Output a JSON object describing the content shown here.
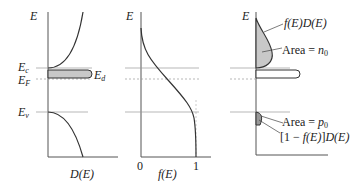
{
  "panels": {
    "dos": {
      "y_label": "E",
      "x_label": "D(E)",
      "levels": {
        "ec": "E",
        "ec_sub": "c",
        "ef": "E",
        "ef_sub": "F",
        "ed": "E",
        "ed_sub": "d",
        "ev": "E",
        "ev_sub": "v"
      }
    },
    "fermi": {
      "y_label": "E",
      "x_label": "f(E)",
      "tick_0": "0",
      "tick_1": "1"
    },
    "carriers": {
      "y_label": "E",
      "curve_label": "f(E)D(E)",
      "area_n": "Area = n",
      "area_n_sub": "0",
      "area_p": "Area = p",
      "area_p_sub": "0",
      "hole_label": "[1 − f(E)]D(E)"
    }
  },
  "colors": {
    "line": "#444444",
    "guide": "#999999",
    "fill": "#c8c8c8"
  }
}
